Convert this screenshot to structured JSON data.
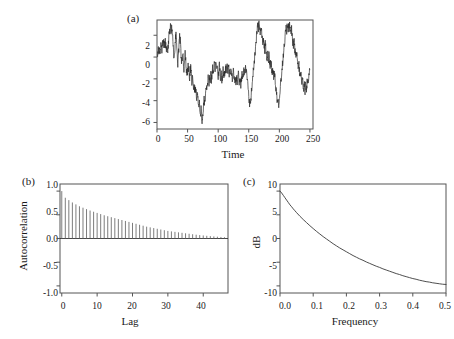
{
  "figure": {
    "background": "#ffffff",
    "line_color": "#2b2b2b",
    "frame_color": "#555555"
  },
  "chart_data": [
    {
      "type": "line",
      "panel_tag": "(a)",
      "title": "",
      "xlabel": "Time",
      "ylabel": "",
      "xlim": [
        0,
        255
      ],
      "ylim": [
        -6.6,
        3.4
      ],
      "xticks": [
        0,
        50,
        100,
        150,
        200,
        250
      ],
      "xtick_labels": [
        "0",
        "50",
        "100",
        "150",
        "200",
        "250"
      ],
      "yticks": [
        2,
        0,
        -2,
        -4,
        -6
      ],
      "ytick_labels": [
        "2",
        "0",
        "-2",
        "-4",
        "-6"
      ],
      "grid": false,
      "legend": "none",
      "description": "Simulated ARMA/long-memory time series realization of length 250",
      "x": [
        0,
        1,
        2,
        3,
        4,
        5,
        6,
        7,
        8,
        9,
        10,
        11,
        12,
        13,
        14,
        15,
        16,
        17,
        18,
        19,
        20,
        21,
        22,
        23,
        24,
        25,
        26,
        27,
        28,
        29,
        30,
        31,
        32,
        33,
        34,
        35,
        36,
        37,
        38,
        39,
        40,
        41,
        42,
        43,
        44,
        45,
        46,
        47,
        48,
        49,
        50,
        51,
        52,
        53,
        54,
        55,
        56,
        57,
        58,
        59,
        60,
        61,
        62,
        63,
        64,
        65,
        66,
        67,
        68,
        69,
        70,
        71,
        72,
        73,
        74,
        75,
        76,
        77,
        78,
        79,
        80,
        81,
        82,
        83,
        84,
        85,
        86,
        87,
        88,
        89,
        90,
        91,
        92,
        93,
        94,
        95,
        96,
        97,
        98,
        99,
        100,
        101,
        102,
        103,
        104,
        105,
        106,
        107,
        108,
        109,
        110,
        111,
        112,
        113,
        114,
        115,
        116,
        117,
        118,
        119,
        120,
        121,
        122,
        123,
        124,
        125,
        126,
        127,
        128,
        129,
        130,
        131,
        132,
        133,
        134,
        135,
        136,
        137,
        138,
        139,
        140,
        141,
        142,
        143,
        144,
        145,
        146,
        147,
        148,
        149,
        150,
        151,
        152,
        153,
        154,
        155,
        156,
        157,
        158,
        159,
        160,
        161,
        162,
        163,
        164,
        165,
        166,
        167,
        168,
        169,
        170,
        171,
        172,
        173,
        174,
        175,
        176,
        177,
        178,
        179,
        180,
        181,
        182,
        183,
        184,
        185,
        186,
        187,
        188,
        189,
        190,
        191,
        192,
        193,
        194,
        195,
        196,
        197,
        198,
        199,
        200,
        201,
        202,
        203,
        204,
        205,
        206,
        207,
        208,
        209,
        210,
        211,
        212,
        213,
        214,
        215,
        216,
        217,
        218,
        219,
        220,
        221,
        222,
        223,
        224,
        225,
        226,
        227,
        228,
        229,
        230,
        231,
        232,
        233,
        234,
        235,
        236,
        237,
        238,
        239,
        240,
        241,
        242,
        243,
        244,
        245,
        246,
        247,
        248,
        249
      ],
      "values": [
        0.55,
        0.2,
        1.0,
        0.35,
        0.6,
        0.0,
        0.85,
        1.1,
        0.5,
        1.25,
        1.05,
        1.45,
        0.85,
        1.7,
        1.2,
        0.6,
        1.0,
        0.35,
        0.95,
        1.5,
        2.35,
        2.1,
        2.7,
        2.3,
        2.75,
        2.4,
        1.5,
        0.4,
        -0.3,
        0.5,
        1.6,
        2.2,
        1.35,
        0.1,
        -0.55,
        0.2,
        1.05,
        1.95,
        1.5,
        0.45,
        -0.6,
        -0.15,
        0.5,
        -0.4,
        -1.25,
        -0.55,
        0.3,
        -0.3,
        -1.1,
        -1.9,
        -1.3,
        -0.5,
        -1.2,
        -2.0,
        -1.45,
        -0.85,
        -1.5,
        -2.35,
        -1.9,
        -2.55,
        -3.1,
        -2.6,
        -3.2,
        -2.75,
        -3.35,
        -3.9,
        -3.35,
        -4.0,
        -4.5,
        -4.05,
        -4.7,
        -5.3,
        -4.8,
        -5.45,
        -5.9,
        -5.3,
        -4.6,
        -3.9,
        -4.4,
        -3.7,
        -3.0,
        -2.5,
        -2.9,
        -2.35,
        -1.8,
        -2.3,
        -1.75,
        -2.2,
        -1.6,
        -2.1,
        -1.5,
        -1.0,
        -1.55,
        -1.0,
        -0.45,
        -1.0,
        -0.5,
        -1.15,
        -0.6,
        -1.2,
        -1.8,
        -1.3,
        -0.8,
        -1.4,
        -2.0,
        -1.5,
        -2.1,
        -1.6,
        -1.1,
        -1.7,
        -1.2,
        -1.75,
        -1.25,
        -0.75,
        -1.3,
        -0.8,
        -1.35,
        -0.85,
        -1.45,
        -1.0,
        -1.6,
        -1.15,
        -1.7,
        -2.25,
        -1.75,
        -1.2,
        -1.8,
        -2.35,
        -1.85,
        -2.4,
        -1.9,
        -2.45,
        -1.95,
        -1.45,
        -2.0,
        -2.55,
        -2.05,
        -2.6,
        -2.1,
        -1.55,
        -2.15,
        -1.6,
        -1.1,
        -1.65,
        -1.15,
        -0.65,
        -1.2,
        -1.8,
        -2.4,
        -3.0,
        -3.6,
        -4.2,
        -4.6,
        -4.0,
        -3.4,
        -2.8,
        -2.2,
        -1.6,
        -1.0,
        -0.4,
        0.2,
        0.85,
        1.45,
        2.0,
        2.55,
        3.1,
        2.6,
        3.2,
        2.7,
        2.15,
        2.75,
        2.25,
        1.7,
        1.15,
        1.7,
        1.2,
        0.65,
        1.2,
        0.7,
        0.15,
        -0.4,
        0.15,
        -0.35,
        0.2,
        -0.3,
        -0.85,
        -0.35,
        -0.9,
        -1.4,
        -0.9,
        -1.45,
        -1.95,
        -1.45,
        -2.0,
        -2.55,
        -3.1,
        -3.65,
        -4.2,
        -3.7,
        -4.25,
        -3.7,
        -3.1,
        -2.5,
        -1.9,
        -1.3,
        -0.7,
        -0.1,
        0.5,
        1.1,
        1.7,
        2.3,
        2.85,
        2.4,
        2.9,
        2.45,
        2.95,
        2.5,
        2.95,
        2.55,
        2.0,
        2.5,
        2.0,
        1.45,
        0.95,
        1.45,
        0.95,
        0.4,
        -0.1,
        0.4,
        -0.15,
        -0.7,
        -1.25,
        -0.75,
        -1.3,
        -1.85,
        -1.35,
        -1.9,
        -2.45,
        -1.95,
        -2.5,
        -3.0,
        -2.5,
        -3.05,
        -2.55,
        -3.05,
        -2.55,
        -2.05,
        -2.6,
        -2.1,
        -1.55,
        -1.05,
        -0.5,
        0.05,
        0.65,
        1.2
      ]
    },
    {
      "type": "bar",
      "panel_tag": "(b)",
      "title": "",
      "xlabel": "Lag",
      "ylabel": "Autocorrelation",
      "xlim": [
        -0.5,
        47
      ],
      "ylim": [
        -1.15,
        1.15
      ],
      "xticks": [
        0,
        10,
        20,
        30,
        40
      ],
      "xtick_labels": [
        "0",
        "10",
        "20",
        "30",
        "40"
      ],
      "yticks": [
        1.0,
        0.5,
        0.0,
        -0.5,
        -1.0
      ],
      "ytick_labels": [
        "1.0",
        "0.5",
        "0.0",
        "-0.5",
        "-1.0"
      ],
      "grid": false,
      "legend": "none",
      "description": "Sample autocorrelation function decaying slowly from 1.0 toward 0",
      "categories": [
        0,
        1,
        2,
        3,
        4,
        5,
        6,
        7,
        8,
        9,
        10,
        11,
        12,
        13,
        14,
        15,
        16,
        17,
        18,
        19,
        20,
        21,
        22,
        23,
        24,
        25,
        26,
        27,
        28,
        29,
        30,
        31,
        32,
        33,
        34,
        35,
        36,
        37,
        38,
        39,
        40,
        41,
        42,
        43,
        44,
        45,
        46
      ],
      "values": [
        1.0,
        0.86,
        0.81,
        0.76,
        0.72,
        0.68,
        0.65,
        0.62,
        0.59,
        0.565,
        0.54,
        0.515,
        0.49,
        0.47,
        0.45,
        0.43,
        0.41,
        0.39,
        0.37,
        0.35,
        0.33,
        0.31,
        0.29,
        0.27,
        0.25,
        0.235,
        0.22,
        0.205,
        0.19,
        0.175,
        0.16,
        0.15,
        0.14,
        0.13,
        0.12,
        0.11,
        0.1,
        0.09,
        0.08,
        0.072,
        0.064,
        0.057,
        0.05,
        0.044,
        0.038,
        0.032,
        0.027
      ]
    },
    {
      "type": "line",
      "panel_tag": "(c)",
      "title": "",
      "xlabel": "Frequency",
      "ylabel": "dB",
      "xlim": [
        0,
        0.5
      ],
      "ylim": [
        -11.5,
        11.5
      ],
      "xticks": [
        0.0,
        0.1,
        0.2,
        0.3,
        0.4,
        0.5
      ],
      "xtick_labels": [
        "0.0",
        "0.1",
        "0.2",
        "0.3",
        "0.4",
        "0.5"
      ],
      "yticks": [
        10,
        5,
        0,
        -5,
        -10
      ],
      "ytick_labels": [
        "10",
        "5",
        "0",
        "-5",
        "-10"
      ],
      "grid": false,
      "legend": "none",
      "description": "Theoretical spectral density in decibels, monotonically decreasing from about 10 dB at frequency 0 to about -9.7 dB at frequency 0.5",
      "x": [
        0.0,
        0.005,
        0.01,
        0.015,
        0.02,
        0.025,
        0.03,
        0.035,
        0.04,
        0.045,
        0.05,
        0.06,
        0.07,
        0.08,
        0.09,
        0.1,
        0.11,
        0.12,
        0.13,
        0.14,
        0.15,
        0.16,
        0.17,
        0.18,
        0.19,
        0.2,
        0.21,
        0.22,
        0.23,
        0.24,
        0.25,
        0.26,
        0.27,
        0.28,
        0.29,
        0.3,
        0.31,
        0.32,
        0.33,
        0.34,
        0.35,
        0.36,
        0.37,
        0.38,
        0.39,
        0.4,
        0.41,
        0.42,
        0.43,
        0.44,
        0.45,
        0.46,
        0.47,
        0.48,
        0.49,
        0.5
      ],
      "values": [
        10.0,
        9.6,
        9.1,
        8.6,
        8.1,
        7.6,
        7.1,
        6.7,
        6.25,
        5.85,
        5.45,
        4.7,
        4.0,
        3.35,
        2.7,
        2.1,
        1.5,
        0.95,
        0.4,
        -0.1,
        -0.6,
        -1.1,
        -1.55,
        -2.0,
        -2.4,
        -2.8,
        -3.2,
        -3.6,
        -3.95,
        -4.3,
        -4.6,
        -4.95,
        -5.25,
        -5.55,
        -5.85,
        -6.1,
        -6.4,
        -6.65,
        -6.9,
        -7.15,
        -7.4,
        -7.6,
        -7.85,
        -8.05,
        -8.25,
        -8.45,
        -8.6,
        -8.8,
        -8.95,
        -9.1,
        -9.2,
        -9.35,
        -9.45,
        -9.55,
        -9.65,
        -9.7
      ]
    }
  ]
}
